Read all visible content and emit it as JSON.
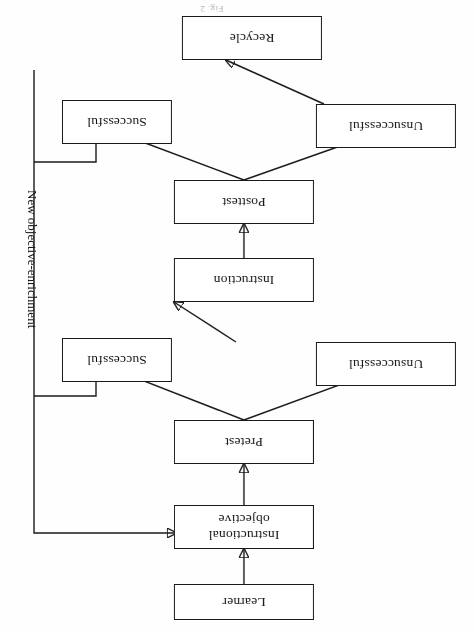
{
  "figure": {
    "caption": "Fig. 2",
    "orientation": "rotated-180",
    "nodes": {
      "learner": "Learner",
      "instructional_objective_line1": "Instructional",
      "instructional_objective_line2": "objective",
      "pretest": "Pretest",
      "pretest_unsuccessful": "Unsuccessful",
      "pretest_successful": "Successful",
      "instruction": "Instruction",
      "posttest": "Posttest",
      "posttest_unsuccessful": "Unsuccessful",
      "posttest_successful": "Successful",
      "recycle": "Recycle"
    },
    "edge_labels": {
      "feedback": "New objective-enrichment"
    },
    "colors": {
      "stroke": "#1a1a1a",
      "box_fill": "#ffffff",
      "page": "#fefefe",
      "text": "#111111"
    }
  }
}
